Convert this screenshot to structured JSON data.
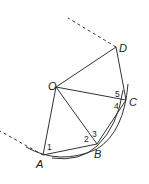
{
  "diagram": {
    "type": "geometry-construction",
    "points": {
      "O": {
        "label": "O",
        "x": 56,
        "y": 87
      },
      "D": {
        "label": "D",
        "x": 116,
        "y": 47
      },
      "C": {
        "label": "C",
        "x": 126,
        "y": 100
      },
      "B": {
        "label": "B",
        "x": 97,
        "y": 144
      },
      "A": {
        "label": "A",
        "x": 43,
        "y": 155
      }
    },
    "segments": [
      "O-D",
      "D-C",
      "O-C",
      "O-B",
      "O-A",
      "A-B",
      "B-C"
    ],
    "dashed_lines": [
      {
        "from": "D",
        "to_x": 68,
        "to_y": 18
      },
      {
        "from": "A",
        "to_x": 0,
        "to_y": 131
      }
    ],
    "angle_labels": [
      {
        "text": "1",
        "x": 47,
        "y": 149
      },
      {
        "text": "2",
        "x": 84,
        "y": 141
      },
      {
        "text": "3",
        "x": 92,
        "y": 136
      },
      {
        "text": "4",
        "x": 114,
        "y": 108
      },
      {
        "text": "5",
        "x": 115,
        "y": 96
      }
    ],
    "colors": {
      "stroke": "#333333",
      "background": "#ffffff"
    }
  }
}
